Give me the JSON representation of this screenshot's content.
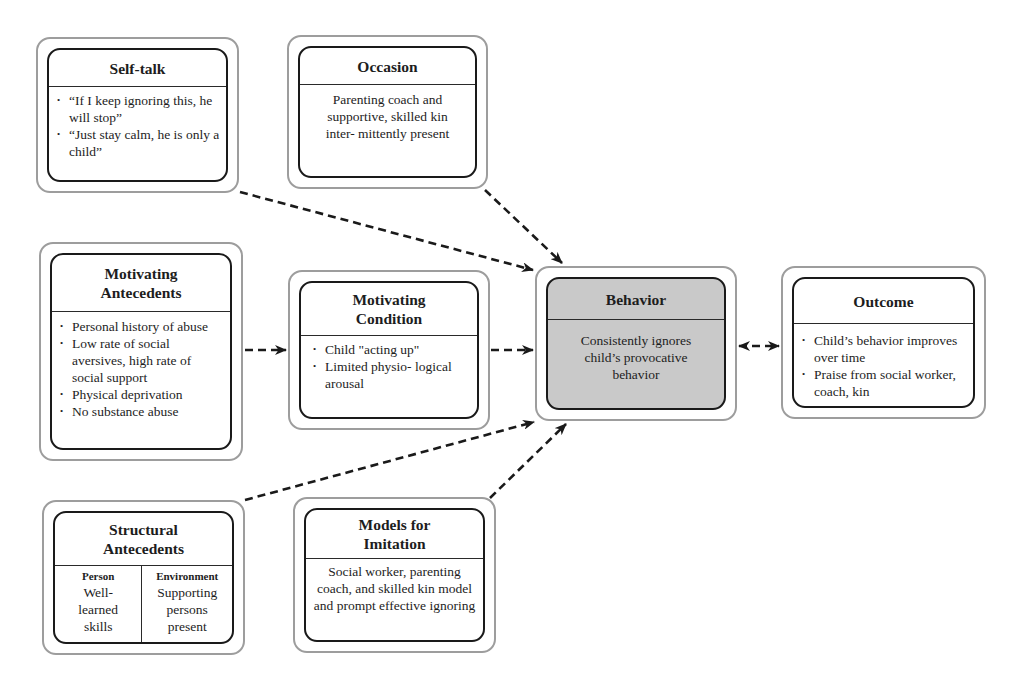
{
  "diagram": {
    "top_partial_text": "ying change",
    "nodes": {
      "self_talk": {
        "title": "Self-talk",
        "items": [
          "“If I keep ignoring this, he will stop”",
          "“Just stay calm, he is only a child”"
        ]
      },
      "occasion": {
        "title": "Occasion",
        "text": "Parenting coach and supportive, skilled kin inter- mittently present"
      },
      "motivating_antecedents": {
        "title_line1": "Motivating",
        "title_line2": "Antecedents",
        "items": [
          "Personal history of abuse",
          "Low rate of social aversives, high rate of social support",
          "Physical deprivation",
          "No substance abuse"
        ]
      },
      "motivating_condition": {
        "title_line1": "Motivating",
        "title_line2": "Condition",
        "items": [
          "Child \"acting up\"",
          "Limited physio- logical arousal"
        ]
      },
      "behavior": {
        "title": "Behavior",
        "text": "Consistently ignores child’s provocative behavior",
        "fill": "#c9c9c9"
      },
      "outcome": {
        "title": "Outcome",
        "items": [
          "Child’s behavior improves over time",
          "Praise from social worker, coach, kin"
        ]
      },
      "structural_antecedents": {
        "title_line1": "Structural",
        "title_line2": "Antecedents",
        "columns": [
          {
            "label": "Person",
            "text": "Well- learned skills"
          },
          {
            "label": "Environment",
            "text": "Supporting persons present"
          }
        ]
      },
      "models_for_imitation": {
        "title_line1": "Models for",
        "title_line2": "Imitation",
        "text": "Social worker, parenting coach, and skilled kin model and prompt effective ignoring"
      }
    },
    "edges": [
      {
        "from": "self_talk",
        "to": "behavior",
        "style": "dashed"
      },
      {
        "from": "occasion",
        "to": "behavior",
        "style": "dashed"
      },
      {
        "from": "motivating_antecedents",
        "to": "motivating_condition",
        "style": "dashed"
      },
      {
        "from": "motivating_condition",
        "to": "behavior",
        "style": "dashed"
      },
      {
        "from": "behavior",
        "to": "outcome",
        "style": "dashed",
        "bidirectional": true
      },
      {
        "from": "structural_antecedents",
        "to": "behavior",
        "style": "dashed"
      },
      {
        "from": "models_for_imitation",
        "to": "behavior",
        "style": "dashed"
      }
    ]
  }
}
